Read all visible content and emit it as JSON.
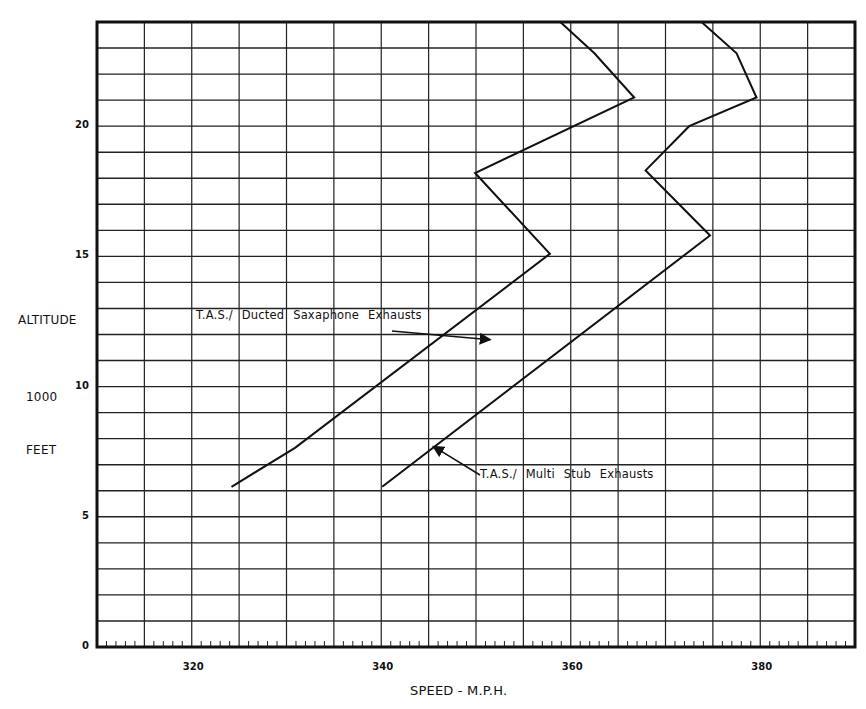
{
  "chart_data": {
    "type": "line",
    "title": "",
    "xlabel": "SPEED - M.P.H.",
    "ylabel_lines": [
      "ALTITUDE",
      "1000",
      "FEET"
    ],
    "xlim": [
      310,
      390
    ],
    "ylim": [
      0,
      24
    ],
    "x_ticks": [
      320,
      340,
      360,
      380
    ],
    "y_ticks": [
      0,
      5,
      10,
      15,
      20
    ],
    "grid": {
      "x_step": 5,
      "y_step": 1,
      "minor_x_ticks_step": 1
    },
    "series": [
      {
        "name": "T.A.S./ Ducted Saxaphone Exhausts",
        "points": [
          [
            324.2,
            6.15
          ],
          [
            330.9,
            7.65
          ],
          [
            357.8,
            15.1
          ],
          [
            349.9,
            18.2
          ],
          [
            366.7,
            21.1
          ],
          [
            362.5,
            22.8
          ],
          [
            358.9,
            24.0
          ]
        ]
      },
      {
        "name": "T.A.S./ Multi Stub Exhausts",
        "points": [
          [
            340.1,
            6.15
          ],
          [
            374.7,
            15.8
          ],
          [
            367.9,
            18.3
          ],
          [
            372.5,
            20.0
          ],
          [
            379.6,
            21.1
          ],
          [
            377.5,
            22.8
          ],
          [
            373.8,
            24.0
          ]
        ]
      }
    ],
    "annotations": [
      {
        "text": "T.A.S./ Ducted Saxaphone Exhausts",
        "arrow_to": [
          351.5,
          11.8
        ]
      },
      {
        "text": "T.A.S./ Multi Stub Exhausts",
        "arrow_to": [
          345.5,
          7.7
        ]
      }
    ]
  },
  "labels": {
    "y_title_1": "ALTITUDE",
    "y_title_2": "1000",
    "y_title_3": "FEET",
    "x_title": "SPEED - M.P.H.",
    "ann1": "T.A.S./ Ducted Saxaphone Exhausts",
    "ann2": "T.A.S./ Multi Stub Exhausts"
  }
}
